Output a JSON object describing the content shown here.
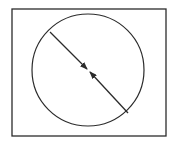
{
  "diagram": {
    "colors": {
      "background": "#ffffff",
      "stroke": "#2b2b2b"
    },
    "frame": {
      "x": 12,
      "y": 9,
      "width": 154,
      "height": 127,
      "stroke_width": 1.3
    },
    "circle": {
      "cx": 88,
      "cy": 70,
      "r": 56,
      "stroke_width": 1.2
    },
    "diameter": {
      "start": {
        "x": 50,
        "y": 32
      },
      "end": {
        "x": 128,
        "y": 113
      },
      "stroke_width": 1.3,
      "segments": [
        {
          "from": {
            "x": 50,
            "y": 32
          },
          "to": {
            "x": 87,
            "y": 69
          },
          "arrowhead": "end",
          "direction": "toward-center"
        },
        {
          "from": {
            "x": 128,
            "y": 113
          },
          "to": {
            "x": 90,
            "y": 72
          },
          "arrowhead": "end",
          "direction": "toward-center"
        }
      ]
    },
    "icons": {
      "arrow_upper": "arrowhead-pointing-down-right",
      "arrow_lower": "arrowhead-pointing-up-left"
    }
  }
}
